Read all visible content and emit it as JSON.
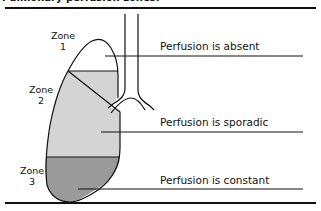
{
  "figure": {
    "title": "Pulmonary perfusion zones.",
    "colors": {
      "line": "#111111",
      "zone1_fill": "#ffffff",
      "zone2_fill": "#d4d4d4",
      "zone3_fill": "#9a9a9a"
    },
    "zones": [
      {
        "label": "Zone",
        "number": "1",
        "description": "Perfusion is absent"
      },
      {
        "label": "Zone",
        "number": "2",
        "description": "Perfusion is sporadic"
      },
      {
        "label": "Zone",
        "number": "3",
        "description": "Perfusion is constant"
      }
    ]
  }
}
